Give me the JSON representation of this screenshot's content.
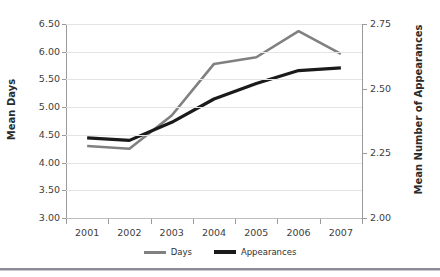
{
  "chart_data": {
    "type": "line",
    "title": "",
    "xlabel": "",
    "categories": [
      "2001",
      "2002",
      "2003",
      "2004",
      "2005",
      "2006",
      "2007"
    ],
    "grid": true,
    "legend_position": "bottom",
    "axes": {
      "left": {
        "label": "Mean Days",
        "ylim": [
          3.0,
          6.5
        ],
        "ticks": [
          "6.50",
          "6.00",
          "5.50",
          "5.00",
          "4.50",
          "4.00",
          "3.50",
          "3.00"
        ],
        "tick_values": [
          6.5,
          6.0,
          5.5,
          5.0,
          4.5,
          4.0,
          3.5,
          3.0
        ],
        "step": 0.5
      },
      "right": {
        "label": "Mean Number of Appearances",
        "ylim": [
          2.0,
          2.75
        ],
        "ticks": [
          "2.75",
          "2.50",
          "2.25",
          "2.00"
        ],
        "tick_values": [
          2.75,
          2.5,
          2.25,
          2.0
        ],
        "step": 0.25
      }
    },
    "series": [
      {
        "name": "Days",
        "axis": "left",
        "color": "#808080",
        "width": 2.6,
        "values": [
          4.3,
          4.25,
          4.85,
          5.78,
          5.9,
          6.37,
          5.96
        ]
      },
      {
        "name": "Appearances",
        "axis": "right",
        "color": "#1a1a1a",
        "width": 3.2,
        "values": [
          2.31,
          2.3,
          2.37,
          2.46,
          2.52,
          2.57,
          2.58
        ]
      }
    ]
  },
  "legend": {
    "items": [
      {
        "label": "Days",
        "color": "#808080"
      },
      {
        "label": "Appearances",
        "color": "#1a1a1a"
      }
    ]
  },
  "colors": {
    "days": "#808080",
    "appearances": "#1a1a1a",
    "grid": "#e4e4e4",
    "axis": "#9a9a9a",
    "text": "#404040"
  }
}
